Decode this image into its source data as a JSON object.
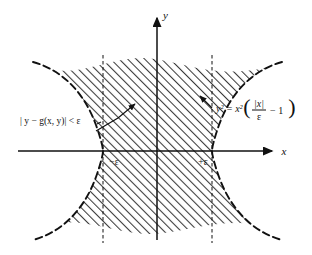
{
  "figure": {
    "kind": "math-diagram",
    "background_color": "#ffffff",
    "ink_color": "#111111",
    "hatch_color": "#3a3a3a",
    "axes": {
      "x_label": "x",
      "y_label": "y",
      "origin_label": ""
    },
    "ticks": [
      {
        "name": "neg-epsilon",
        "label": "−ε"
      },
      {
        "name": "pos-epsilon",
        "label": "+ε"
      }
    ],
    "annotations": {
      "inequality": "| y − g(x, y)| < ε",
      "curve_equation_lhs": "y² = x²",
      "curve_equation_num": "|x|",
      "curve_equation_den": "ε",
      "curve_equation_tail": "− 1"
    },
    "region": {
      "name": "shaded-region",
      "description": "hatched set where |y − g(x,y)| < ε"
    },
    "curves": {
      "boundary_style": "dashed",
      "name": "cubic-boundary-curve"
    }
  }
}
